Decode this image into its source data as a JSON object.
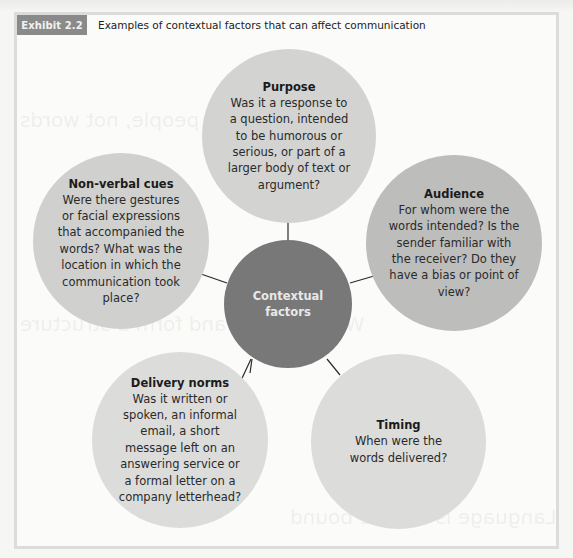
{
  "exhibit": {
    "badge": "Exhibit 2.2",
    "title": "Examples of contextual factors that can affect communication"
  },
  "diagram": {
    "center": {
      "label": "Contextual factors",
      "color": "#787878"
    },
    "nodes": [
      {
        "id": "purpose",
        "title": "Purpose",
        "body": "Was it a response to a question, intended to be humorous or serious, or part of a larger body of text or argument?",
        "color": "#d3d3d2"
      },
      {
        "id": "audience",
        "title": "Audience",
        "body": "For whom were the words intended? Is the sender familiar with the receiver? Do they have a bias or point of view?",
        "color": "#bdbdbc"
      },
      {
        "id": "timing",
        "title": "Timing",
        "body": "When were the words delivered?",
        "color": "#dcdcdb"
      },
      {
        "id": "delivery-norms",
        "title": "Delivery norms",
        "body": "Was it written or spoken, an informal email, a short message left on an answering service or a formal letter on a company letterhead?",
        "color": "#dcdcdb"
      },
      {
        "id": "non-verbal-cues",
        "title": "Non-verbal cues",
        "body": "Were there gestures or facial expressions that accompanied the words? What was the location in which the communication took place?",
        "color": "#d0d0cf"
      }
    ]
  },
  "bleed_through": {
    "heading1": "Meanings are in people, not words",
    "heading2": "Words create and form a structure",
    "heading3": "Language is culture bound"
  }
}
